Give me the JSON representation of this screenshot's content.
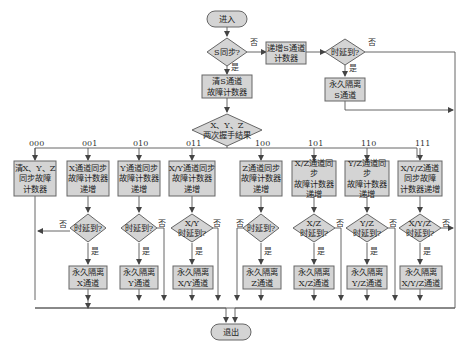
{
  "diagram": {
    "start": "进入",
    "end": "退出",
    "s_sync_question": "S同步?",
    "s_increment": "递增S通道\n计数器",
    "s_timeout_question": "时延到?",
    "s_isolate": "永久隔离\nS通道",
    "s_clear": "清S通道\n故障计数器",
    "xyz_result": "X、Y、Z\n两次握手结果",
    "yes": "是",
    "no": "否",
    "branches": [
      {
        "code": "000",
        "action": "清X、Y、Z\n同步故障\n计数器"
      },
      {
        "code": "001",
        "action": "X通道同步\n故障计数器\n递增",
        "question": "时延到?",
        "isolate": "永久隔离\nX通道"
      },
      {
        "code": "010",
        "action": "Y通道同步\n故障计数器\n递增",
        "question": "时延到?",
        "isolate": "永久隔离\nY通道"
      },
      {
        "code": "011",
        "action": "X/Y通道同步\n故障计数器\n递增",
        "question": "X/Y\n时延到?",
        "isolate": "永久隔离\nX/Y通道"
      },
      {
        "code": "100",
        "action": "Z通道同步\n故障计数器\n递增",
        "question": "时延到?",
        "isolate": "永久隔离\nZ通道"
      },
      {
        "code": "101",
        "action": "X/Z通道同步\n故障计数器\n递增",
        "question": "X/Z\n时延到?",
        "isolate": "永久隔离\nX/Z通道"
      },
      {
        "code": "110",
        "action": "Y/Z通道同步\n故障计数器\n递增",
        "question": "Y/Z\n时延到?",
        "isolate": "永久隔离\nY/Z通道"
      },
      {
        "code": "111",
        "action": "X/Y/Z通道\n同步故障\n计数器递增",
        "question": "X/Y/Z\n时延到?",
        "isolate": "永久隔离\nX/Y/Z通道"
      }
    ],
    "colors": {
      "box_fill": "#d4d4d4",
      "box_stroke": "#666666",
      "line": "#555555"
    }
  }
}
